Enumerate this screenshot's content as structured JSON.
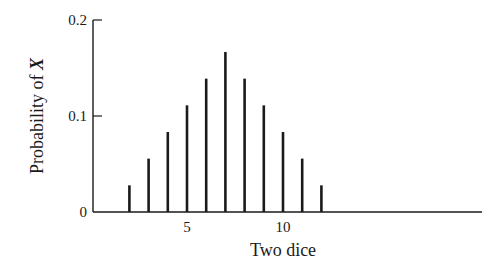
{
  "chart_data": {
    "type": "bar",
    "title": "",
    "xlabel": "Two dice",
    "ylabel": "Probability of X",
    "ylabel_plain": "Probability of ",
    "ylabel_var": "X",
    "x": [
      2,
      3,
      4,
      5,
      6,
      7,
      8,
      9,
      10,
      11,
      12
    ],
    "values": [
      0.0278,
      0.0556,
      0.0833,
      0.1111,
      0.1389,
      0.1667,
      0.1389,
      0.1111,
      0.0833,
      0.0556,
      0.0278
    ],
    "xticks": [
      5,
      10
    ],
    "xtick_labels": [
      "5",
      "10"
    ],
    "yticks": [
      0,
      0.1,
      0.2
    ],
    "ytick_labels": [
      "0",
      "0.1",
      "0.2"
    ],
    "xlim": [
      0,
      22
    ],
    "ylim": [
      0,
      0.2
    ],
    "grid": false,
    "legend": null,
    "bar_style": "thin vertical spikes"
  },
  "style": {
    "bar_color": "#1a1a1a",
    "axis_color": "#1a1a1a",
    "background": "#ffffff"
  }
}
